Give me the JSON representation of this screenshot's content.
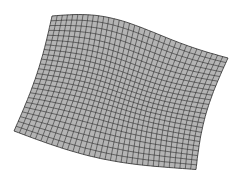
{
  "figure": {
    "title": "",
    "colors": {
      "background": "#ffffff",
      "fill": "#b4b4b4",
      "lines": "#2a2a2a"
    },
    "corners": {
      "top_left": [
        52,
        16
      ],
      "top_right": [
        228,
        58
      ],
      "bottom_right": [
        196,
        172
      ],
      "bottom_left": [
        14,
        131
      ]
    },
    "grid": {
      "u_divisions": 34,
      "v_divisions": 24
    },
    "singular_points": [
      [
        60,
        38
      ],
      [
        38,
        108
      ],
      [
        172,
        72
      ],
      [
        182,
        150
      ]
    ]
  }
}
